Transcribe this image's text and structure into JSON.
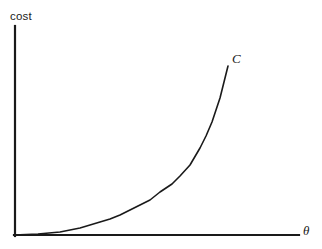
{
  "figure": {
    "width": 322,
    "height": 249,
    "background_color": "#ffffff",
    "ink_color": "#1a1a1a"
  },
  "labels": {
    "ylabel": "cost",
    "xlabel": "θ",
    "curve_label": "C"
  },
  "chart_data": {
    "type": "line",
    "title": "",
    "subtitle": "",
    "xlabel": "θ",
    "ylabel": "cost",
    "grid": false,
    "legend": false,
    "legend_position": "none",
    "axis_style": "open-L-axes-no-ticks",
    "xlim": [
      0,
      1
    ],
    "ylim": [
      0,
      1
    ],
    "xticks": [],
    "yticks": [],
    "xticklabels": [],
    "yticklabels": [],
    "annotations": [
      {
        "text": "C",
        "style": "italic",
        "attached_to": "curve-end",
        "x": 0.77,
        "y": 0.83
      },
      {
        "text": "θ",
        "style": "italic",
        "attached_to": "x-axis-end",
        "x": 1.02,
        "y": 0.0
      },
      {
        "text": "cost",
        "style": "regular",
        "attached_to": "y-axis-top",
        "x": 0.0,
        "y": 1.06
      }
    ],
    "series": [
      {
        "name": "C",
        "description": "convex increasing cost curve",
        "color": "#1a1a1a",
        "linewidth": 1.6,
        "x": [
          0.0,
          0.08,
          0.16,
          0.24,
          0.3,
          0.34,
          0.4,
          0.47,
          0.52,
          0.55,
          0.59,
          0.62,
          0.65,
          0.69,
          0.72,
          0.75,
          0.77
        ],
        "y": [
          0.0,
          0.005,
          0.015,
          0.035,
          0.055,
          0.07,
          0.1,
          0.14,
          0.18,
          0.21,
          0.26,
          0.32,
          0.4,
          0.52,
          0.63,
          0.74,
          0.83
        ]
      }
    ],
    "curve_pixel_points": [
      [
        14,
        235
      ],
      [
        38,
        234
      ],
      [
        60,
        232
      ],
      [
        80,
        228
      ],
      [
        100,
        222
      ],
      [
        110,
        219
      ],
      [
        120,
        215
      ],
      [
        130,
        210
      ],
      [
        140,
        205
      ],
      [
        150,
        200
      ],
      [
        160,
        192
      ],
      [
        172,
        184
      ],
      [
        180,
        176
      ],
      [
        190,
        165
      ],
      [
        200,
        148
      ],
      [
        206,
        136
      ],
      [
        212,
        122
      ],
      [
        216,
        110
      ],
      [
        220,
        98
      ],
      [
        224,
        82
      ],
      [
        228,
        66
      ]
    ]
  }
}
